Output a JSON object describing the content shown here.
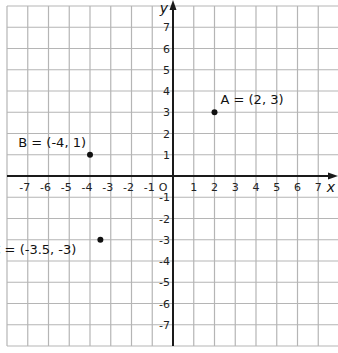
{
  "chart_data": {
    "type": "scatter",
    "title": "",
    "xlabel": "x",
    "ylabel": "y",
    "xlim": [
      -8,
      8
    ],
    "ylim": [
      -8,
      8
    ],
    "grid": true,
    "x_ticks": [
      -7,
      -6,
      -5,
      -4,
      -3,
      -2,
      -1,
      1,
      2,
      3,
      4,
      5,
      6,
      7
    ],
    "y_ticks": [
      7,
      6,
      5,
      4,
      3,
      2,
      1,
      -1,
      -2,
      -3,
      -4,
      -5,
      -6,
      -7
    ],
    "origin_label": "O",
    "points": [
      {
        "name": "A",
        "x": 2,
        "y": 3,
        "label": "A = (2, 3)"
      },
      {
        "name": "B",
        "x": -4,
        "y": 1,
        "label": "B = (-4, 1)"
      },
      {
        "name": "C",
        "x": -3.5,
        "y": -3,
        "label": "C = (-3.5, -3)"
      }
    ]
  },
  "colors": {
    "grid": "#b5b5b5",
    "axis": "#1a1a1a",
    "point": "#111111"
  }
}
